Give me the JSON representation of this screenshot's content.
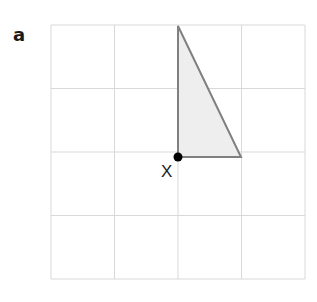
{
  "panel_label": "a",
  "grid": {
    "x0": 51,
    "y0": 25,
    "cell": 63.5,
    "cols": 4,
    "rows": 4,
    "line_color": "#d9d9d9"
  },
  "triangle": {
    "vertices": [
      [
        178,
        26
      ],
      [
        178,
        157
      ],
      [
        241,
        157
      ]
    ],
    "fill": "#eeeeee",
    "stroke": "#808080"
  },
  "point": {
    "name": "X",
    "x": 178,
    "y": 157,
    "color": "#000000",
    "label_x": 161,
    "label_y": 177
  }
}
